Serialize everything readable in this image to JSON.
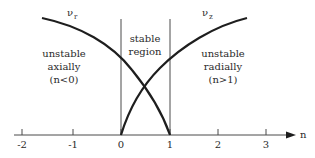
{
  "diagram": {
    "axis": {
      "label": "n",
      "ticks": [
        "-2",
        "-1",
        "0",
        "1",
        "2",
        "3"
      ]
    },
    "curves": {
      "nu_r": {
        "symbol": "ν",
        "subscript": "r"
      },
      "nu_z": {
        "symbol": "ν",
        "subscript": "z"
      }
    },
    "regions": {
      "left": {
        "line1": "unstable",
        "line2": "axially",
        "line3": "(n<0)"
      },
      "middle": {
        "line1": "stable",
        "line2": "region"
      },
      "right": {
        "line1": "unstable",
        "line2": "radially",
        "line3": "(n>1)"
      }
    },
    "colors": {
      "ink": "#1e1e1e",
      "background": "#ffffff"
    }
  }
}
